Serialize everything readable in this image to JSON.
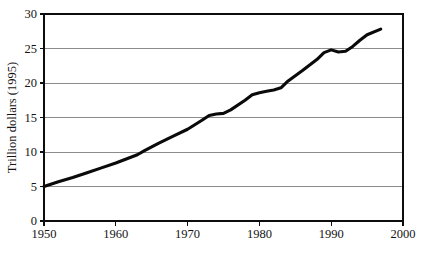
{
  "figure": {
    "cropped_title_fragment": "",
    "background_color": "#ffffff"
  },
  "chart_data": {
    "type": "line",
    "title": "",
    "xlabel": "",
    "ylabel": "Trillion dollars (1995)",
    "xlim": [
      1950,
      2000
    ],
    "ylim": [
      0,
      30
    ],
    "grid": "horizontal",
    "legend": "none",
    "line_color": "#0a0a0a",
    "grid_color": "#8c8c8c",
    "axis_color": "#0d0d0d",
    "xticks": [
      1950,
      1960,
      1970,
      1980,
      1990,
      2000
    ],
    "xtick_labels": [
      "1950",
      "1960",
      "1970",
      "1980",
      "1990",
      "2000"
    ],
    "yticks": [
      0,
      5,
      10,
      15,
      20,
      25,
      30
    ],
    "ytick_labels": [
      "0",
      "5",
      "10",
      "15",
      "20",
      "25",
      "30"
    ],
    "gridline_values": [
      5,
      10,
      15,
      20,
      25,
      30
    ],
    "series": [
      {
        "name": "Gross world product",
        "x": [
          1950,
          1952,
          1954,
          1956,
          1958,
          1960,
          1962,
          1963,
          1964,
          1966,
          1968,
          1970,
          1972,
          1973,
          1974,
          1975,
          1976,
          1978,
          1979,
          1980,
          1981,
          1982,
          1983,
          1984,
          1986,
          1988,
          1989,
          1990,
          1991,
          1992,
          1993,
          1994,
          1995,
          1996.9
        ],
        "y": [
          5.0,
          5.7,
          6.3,
          7.0,
          7.7,
          8.4,
          9.2,
          9.6,
          10.2,
          11.3,
          12.3,
          13.3,
          14.6,
          15.3,
          15.5,
          15.6,
          16.1,
          17.5,
          18.3,
          18.6,
          18.8,
          19.0,
          19.3,
          20.3,
          21.8,
          23.4,
          24.4,
          24.8,
          24.5,
          24.6,
          25.3,
          26.2,
          27.0,
          27.8
        ]
      }
    ]
  }
}
